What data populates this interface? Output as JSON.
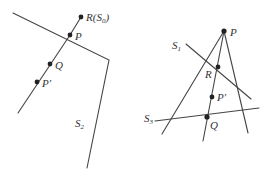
{
  "left_diagram": {
    "labels": {
      "R": "R(",
      "R_S": "S",
      "R_sub": "0",
      "R_close": ")",
      "P": "P",
      "Q": "Q",
      "P_prime": "P′",
      "S2": "S",
      "S2_sub": "2"
    }
  },
  "right_diagram": {
    "labels": {
      "P": "P",
      "R": "R",
      "P_prime": "P′",
      "Q": "Q",
      "S1": "S",
      "S1_sub": "1",
      "S3": "S",
      "S3_sub": "3"
    }
  },
  "colors": {
    "line": "#444444",
    "point": "#222222",
    "text": "#333333",
    "background": "#ffffff"
  }
}
